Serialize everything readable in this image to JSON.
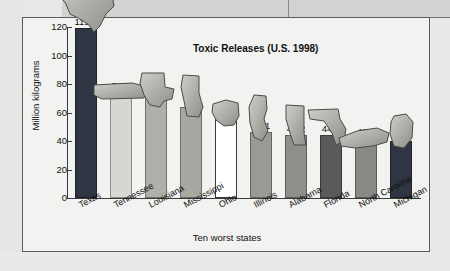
{
  "chart_data": {
    "type": "bar",
    "title": "Toxic Releases (U.S. 1998)",
    "xlabel": "Ten worst states",
    "ylabel": "Million kilograms",
    "ylim": [
      0,
      120
    ],
    "yticks": [
      0,
      20,
      40,
      60,
      80,
      100,
      120
    ],
    "grid": false,
    "legend": "none",
    "categories": [
      "Texas",
      "Tennessee",
      "Louisiana",
      "Mississippi",
      "Ohio",
      "Illinois",
      "Alabama",
      "Florida",
      "North Carolina",
      "Michigan"
    ],
    "values": [
      119.2,
      74.6,
      70.2,
      64,
      56.7,
      46.1,
      44.2,
      44.1,
      42.1,
      40.1
    ],
    "value_labels": [
      "119.2",
      "74.6",
      "70.2",
      "64",
      "56.7",
      "46.1",
      "44.2",
      "44.1",
      "42.1",
      "40.1"
    ],
    "bar_colors": [
      "#2f3542",
      "#d6d6d2",
      "#b0b0ab",
      "#a8a8a3",
      "#ffffff",
      "#9a9a95",
      "#8f8f8a",
      "#5a5a5a",
      "#8a8a85",
      "#2f3542"
    ],
    "annotations": [
      "Each bar is overlaid with the silhouette of its state"
    ]
  },
  "panel": {
    "ytick_labels": [
      "120",
      "100",
      "80",
      "60",
      "40",
      "20",
      "0"
    ]
  }
}
